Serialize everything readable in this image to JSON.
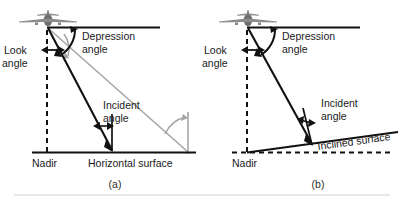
{
  "figure": {
    "type": "radar-geometry-diagram",
    "panels": [
      {
        "id": "a",
        "caption": "(a)",
        "labels": {
          "depression_angle": "Depression",
          "depression_angle_2": "angle",
          "look_angle": "Look",
          "look_angle_2": "angle",
          "incident_angle": "Incident",
          "incident_angle_2": "angle",
          "nadir": "Nadir",
          "surface": "Horizontal surface"
        }
      },
      {
        "id": "b",
        "caption": "(b)",
        "labels": {
          "depression_angle": "Depression",
          "depression_angle_2": "angle",
          "look_angle": "Look",
          "look_angle_2": "angle",
          "incident_angle": "Incident",
          "incident_angle_2": "angle",
          "nadir": "Nadir",
          "surface": "Inclined surface"
        }
      }
    ],
    "icons": {
      "aircraft": "airplane-front-icon"
    },
    "colors": {
      "line_black": "#111111",
      "line_gray": "#a6a6a6",
      "text": "#1a1a1a",
      "background": "#ffffff",
      "rule": "#d2d2d2"
    }
  }
}
